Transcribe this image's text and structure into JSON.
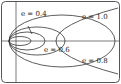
{
  "figure": {
    "type": "conic-sections-by-eccentricity",
    "labels": [
      {
        "id": "e04",
        "text": "e = 0.4"
      },
      {
        "id": "e10",
        "text": "e = 1.0"
      },
      {
        "id": "e06",
        "text": "e = 0.6"
      },
      {
        "id": "e08",
        "text": "e = 0.8"
      }
    ],
    "curves": [
      {
        "e": 0.2,
        "kind": "ellipse"
      },
      {
        "e": 0.4,
        "kind": "ellipse"
      },
      {
        "e": 0.6,
        "kind": "ellipse"
      },
      {
        "e": 0.8,
        "kind": "ellipse"
      },
      {
        "e": 1.0,
        "kind": "parabola"
      }
    ],
    "colors": {
      "stroke": "#333333",
      "border": "#555555",
      "background": "#ffffff"
    }
  }
}
